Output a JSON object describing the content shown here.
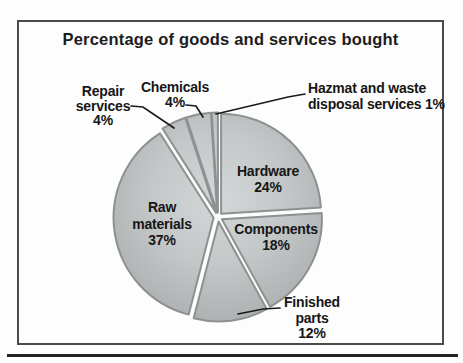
{
  "figure": {
    "frame_color": "#4a4a4a",
    "rule_color": "#242424",
    "background": "#fdfdfd"
  },
  "chart_data": {
    "type": "pie",
    "title": "Percentage of goods and services bought",
    "unit": "%",
    "direction": "clockwise",
    "start_angle_deg": 0,
    "legend": "none",
    "slices": [
      {
        "name": "Hardware",
        "value": 24,
        "label_lines": [
          "Hardware",
          "24%"
        ],
        "align": "center",
        "label_x": 268,
        "label_y": 176,
        "line_spacing": 16
      },
      {
        "name": "Components",
        "value": 18,
        "label_lines": [
          "Components",
          "18%"
        ],
        "align": "center",
        "label_x": 276,
        "label_y": 234,
        "line_spacing": 16
      },
      {
        "name": "Finished parts",
        "value": 12,
        "label_lines": [
          "Finished",
          "parts",
          "12%"
        ],
        "align": "center",
        "label_x": 312,
        "label_y": 307,
        "line_spacing": 15.5,
        "leader": [
          [
            280,
            308
          ],
          [
            263,
            309
          ],
          [
            238,
            314
          ]
        ]
      },
      {
        "name": "Raw materials",
        "value": 37,
        "label_lines": [
          "Raw",
          "materials",
          "37%"
        ],
        "align": "center",
        "label_x": 162,
        "label_y": 212,
        "line_spacing": 16.5
      },
      {
        "name": "Repair services",
        "value": 4,
        "label_lines": [
          "Repair",
          "services",
          "4%"
        ],
        "align": "center",
        "label_x": 103,
        "label_y": 96,
        "line_spacing": 14.5,
        "leader": [
          [
            131,
            106
          ],
          [
            143,
            107
          ],
          [
            174,
            128
          ]
        ]
      },
      {
        "name": "Chemicals",
        "value": 4,
        "label_lines": [
          "Chemicals",
          "4%"
        ],
        "align": "center",
        "label_x": 175,
        "label_y": 92,
        "line_spacing": 15,
        "leader": [
          [
            186,
            105
          ],
          [
            196,
            106
          ],
          [
            203,
            117
          ]
        ]
      },
      {
        "name": "Hazmat and waste disposal services",
        "value": 1,
        "label_lines": [
          "Hazmat and waste",
          "disposal services 1%"
        ],
        "align": "left",
        "label_x": 308,
        "label_y": 93,
        "line_spacing": 15.5,
        "leader": [
          [
            305,
            94
          ],
          [
            288,
            97
          ],
          [
            216,
            114
          ]
        ]
      }
    ],
    "layout": {
      "cx": 218,
      "cy": 217,
      "r": 100,
      "explode": 4.5,
      "fill_inner": "#d4d7d7",
      "fill_mid": "#c3c7c7",
      "fill_outer": "#aeb2b2",
      "edge": "#8d9191",
      "line_color": "#1b1b1b",
      "text_color": "#161616"
    }
  }
}
